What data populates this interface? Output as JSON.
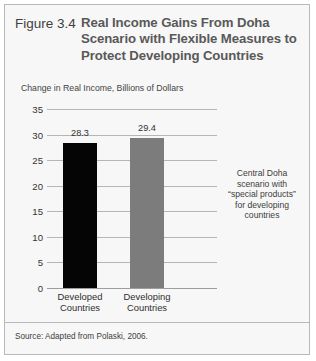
{
  "figure": {
    "number_label": "Figure 3.4",
    "title_lines": [
      "Real Income Gains From Doha",
      "Scenario with Flexible Measures to",
      "Protect Developing Countries"
    ],
    "source_note": "Source: Adapted from Polaski, 2006."
  },
  "annotation": {
    "lines": [
      "Central Doha",
      "scenario with",
      "“special products”",
      "for developing",
      "countries"
    ]
  },
  "chart_data": {
    "type": "bar",
    "title": "Real Income Gains From Doha Scenario with Flexible Measures to Protect Developing Countries",
    "subtitle": "Change in Real Income, Billions of Dollars",
    "xlabel": "",
    "ylabel": "Change in Real Income, Billions of Dollars",
    "ylim": [
      0,
      35
    ],
    "ytick_values": [
      35,
      30,
      25,
      20,
      15,
      10,
      5,
      0
    ],
    "ytick_labels": [
      "35",
      "30",
      "25",
      "20",
      "15",
      "10",
      "5",
      "0"
    ],
    "grid": true,
    "legend": "none",
    "categories": [
      "Developed Countries",
      "Developing Countries"
    ],
    "category_label_lines": [
      [
        "Developed",
        "Countries"
      ],
      [
        "Developing",
        "Countries"
      ]
    ],
    "values": [
      28.3,
      29.4
    ],
    "value_labels": [
      "28.3",
      "29.4"
    ],
    "bar_colors": [
      "#050505",
      "#7c7c7c"
    ]
  }
}
